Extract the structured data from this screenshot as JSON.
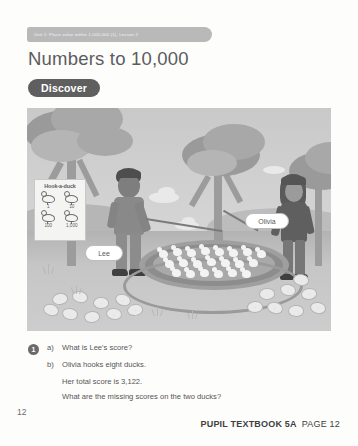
{
  "header": {
    "unit_tab": "Unit 1: Place value within 1,000,000 (1), Lesson 2"
  },
  "title": "Numbers to 10,000",
  "section": {
    "discover_label": "Discover"
  },
  "illustration": {
    "sign": {
      "title": "Hook-a-duck",
      "values": [
        "1",
        "10",
        "100",
        "1,000"
      ]
    },
    "labels": {
      "lee": "Lee",
      "olivia": "Olivia"
    }
  },
  "question": {
    "number": "1",
    "parts": [
      {
        "label": "a)",
        "text": "What is Lee's score?"
      },
      {
        "label": "b)",
        "text": "Olivia hooks eight ducks."
      }
    ],
    "b_line2": "Her total score is 3,122.",
    "b_line3": "What are the missing scores on the two ducks?"
  },
  "footer": {
    "page_number": "12",
    "book": "PUPIL TEXTBOOK 5A",
    "page_label": "PAGE 12"
  }
}
